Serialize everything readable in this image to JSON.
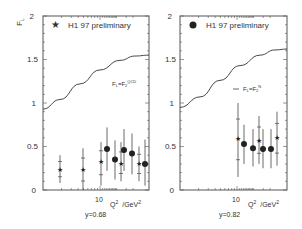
{
  "chart_data": [
    {
      "type": "scatter",
      "panel": "left",
      "ylabel": "F_L",
      "xlabel": "Q² /GeV²",
      "subtitle": "y=0.68",
      "x_scale": "log",
      "x_tick_labels": [
        "10"
      ],
      "y_tick_labels": [
        "0",
        "0.5",
        "1",
        "1.5",
        "2"
      ],
      "ylim": [
        0,
        2
      ],
      "legend": [
        {
          "marker": "star",
          "label": "H1 97 preliminary"
        },
        {
          "marker": "line",
          "label": "F_L=F_2^QCD"
        }
      ],
      "curve": {
        "label": "F_L=F_2^QCD",
        "x_px": [
          43,
          60,
          80,
          100,
          120,
          135,
          149
        ],
        "y": [
          0.93,
          1.04,
          1.22,
          1.38,
          1.49,
          1.54,
          1.55
        ]
      },
      "series": [
        {
          "name": "star",
          "points": [
            {
              "x_px": 60,
              "y": 0.24,
              "ylo": 0.08,
              "yhi": 0.4
            },
            {
              "x_px": 83,
              "y": 0.23,
              "ylo": 0.0,
              "yhi": 0.48
            },
            {
              "x_px": 101,
              "y": 0.33,
              "ylo": 0.05,
              "yhi": 0.55
            },
            {
              "x_px": 121,
              "y": 0.3,
              "ylo": 0.1,
              "yhi": 0.55
            },
            {
              "x_px": 139,
              "y": 0.3,
              "ylo": 0.1,
              "yhi": 0.5
            }
          ]
        },
        {
          "name": "dot",
          "points": [
            {
              "x_px": 107,
              "y": 0.47,
              "ylo": 0.22,
              "yhi": 0.72
            },
            {
              "x_px": 115,
              "y": 0.35,
              "ylo": 0.12,
              "yhi": 0.57
            },
            {
              "x_px": 124,
              "y": 0.46,
              "ylo": 0.22,
              "yhi": 0.7
            },
            {
              "x_px": 132,
              "y": 0.42,
              "ylo": 0.18,
              "yhi": 0.65
            },
            {
              "x_px": 145,
              "y": 0.3,
              "ylo": 0.05,
              "yhi": 0.58
            }
          ]
        }
      ]
    },
    {
      "type": "scatter",
      "panel": "right",
      "xlabel": "Q² /GeV²",
      "subtitle": "y=0.82",
      "x_scale": "log",
      "x_tick_labels": [
        "10"
      ],
      "y_tick_labels": [
        "0",
        "0.5",
        "1",
        "1.5",
        "2"
      ],
      "ylim": [
        0,
        2
      ],
      "legend": [
        {
          "marker": "dot",
          "label": "H1 97 preliminary"
        },
        {
          "marker": "line",
          "label": "F_L=F_2^N"
        }
      ],
      "curve": {
        "label": "F_L=F_2^N",
        "x_px": [
          180,
          200,
          220,
          240,
          260,
          275,
          287
        ],
        "y": [
          0.95,
          1.07,
          1.26,
          1.43,
          1.55,
          1.61,
          1.62
        ]
      },
      "series": [
        {
          "name": "star",
          "points": [
            {
              "x_px": 238,
              "y": 0.59,
              "ylo": 0.15,
              "yhi": 1.0
            },
            {
              "x_px": 259,
              "y": 0.57,
              "ylo": 0.3,
              "yhi": 0.85
            },
            {
              "x_px": 277,
              "y": 0.6,
              "ylo": 0.28,
              "yhi": 0.9
            }
          ]
        },
        {
          "name": "dot",
          "points": [
            {
              "x_px": 244,
              "y": 0.53,
              "ylo": 0.3,
              "yhi": 0.75
            },
            {
              "x_px": 253,
              "y": 0.48,
              "ylo": 0.27,
              "yhi": 0.7
            },
            {
              "x_px": 263,
              "y": 0.47,
              "ylo": 0.25,
              "yhi": 0.7
            },
            {
              "x_px": 271,
              "y": 0.47,
              "ylo": 0.25,
              "yhi": 0.7
            }
          ]
        }
      ]
    }
  ],
  "labels": {
    "fl_axis": "F",
    "fl_sub": "L",
    "legend_title": "H1 97 preliminary",
    "left_curve_label_main": "F",
    "left_curve_label_sub1": "L",
    "left_curve_eq": "=F",
    "left_curve_sub2": "2",
    "left_curve_sup": "QCD",
    "right_curve_sup": "N",
    "tick_10": "10",
    "q2": "Q",
    "q2_sup": "2",
    "gev": "/GeV",
    "gev_sup": "2",
    "left_y": "y=0.68",
    "right_y": "y=0.82",
    "yt_0": "0",
    "yt_05": "0.5",
    "yt_1": "1",
    "yt_15": "1.5",
    "yt_2": "2"
  }
}
